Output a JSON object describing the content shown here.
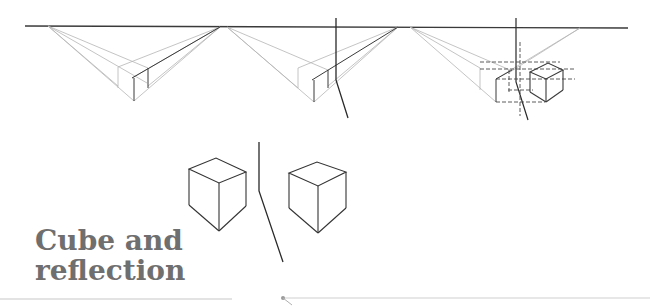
{
  "title": {
    "line1": "Cube and",
    "line2": "reflection"
  },
  "colors": {
    "horizon": "#3a3a3a",
    "construction": "#b5b5b5",
    "mirror": "#2a2a2a",
    "cube": "#3a3a3a",
    "title": "#6f6f6f",
    "rule": "#c8c8c8"
  },
  "figures": [
    {
      "name": "step-1-construction",
      "description": "Two-point perspective box with vanishing lines"
    },
    {
      "name": "step-2-construction-with-mirror",
      "description": "Box construction beside a vertical mirror line"
    },
    {
      "name": "step-3-reflection-construction",
      "description": "Dashed reflection construction of cube across mirror"
    },
    {
      "name": "cube-pair",
      "description": "Cube and its reflection on either side of a mirror line"
    }
  ]
}
